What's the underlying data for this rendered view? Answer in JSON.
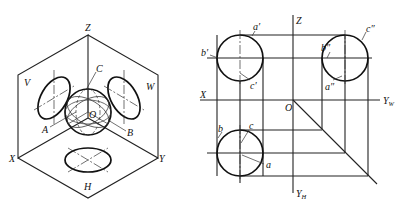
{
  "figure_left": {
    "title": "isometric projection of sphere in three projection planes",
    "labels": {
      "z": "Z",
      "x": "X",
      "y": "Y",
      "v": "V",
      "w": "W",
      "h": "H",
      "o": "O",
      "a": "A",
      "b": "B",
      "c": "C"
    }
  },
  "figure_right": {
    "title": "three-view orthographic projection of sphere",
    "labels": {
      "z": "Z",
      "x": "X",
      "o": "O",
      "yw": "Y",
      "yw_sub": "W",
      "yh": "Y",
      "yh_sub": "H",
      "a_front": "a′",
      "b_front": "b′",
      "c_front": "c′",
      "a_side": "a″",
      "b_side": "b″",
      "c_side": "c″",
      "a_top": "a",
      "b_top": "b",
      "c_top": "c"
    }
  }
}
